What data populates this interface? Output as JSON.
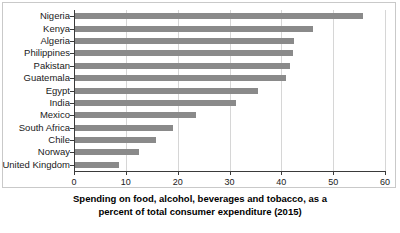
{
  "chart_data": {
    "type": "bar",
    "orientation": "horizontal",
    "title": "",
    "xlabel": "Spending on food, alcohol, beverages and tobacco, as a percent of total consumer expenditure (2015)",
    "ylabel": "",
    "xlim": [
      0,
      60
    ],
    "xticks": [
      0,
      10,
      20,
      30,
      40,
      50,
      60
    ],
    "xtick_labels": [
      "0",
      "10",
      "20",
      "30",
      "40",
      "50",
      "60"
    ],
    "grid": true,
    "grid_axis": "x",
    "legend": false,
    "bar_color": "#8a8a8a",
    "categories": [
      "Nigeria",
      "Kenya",
      "Algeria",
      "Philippines",
      "Pakistan",
      "Guatemala",
      "Egypt",
      "India",
      "Mexico",
      "South Africa",
      "Chile",
      "Norway",
      "United Kingdom"
    ],
    "values": [
      55.6,
      46.0,
      42.3,
      42.0,
      41.5,
      40.7,
      35.3,
      31.0,
      23.4,
      19.0,
      15.6,
      12.4,
      8.5
    ]
  },
  "axis_title": {
    "line1": "Spending on food, alcohol, beverages and tobacco, as a",
    "line2": "percent of total consumer expenditure (2015)"
  }
}
